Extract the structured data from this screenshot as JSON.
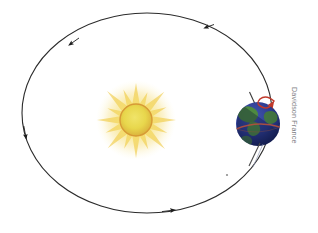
{
  "figure": {
    "background_color": "#ffffff",
    "width": 318,
    "height": 233
  },
  "orbit": {
    "label": "Earth orbital path",
    "shape": "ellipse",
    "center_x": 147,
    "center_y": 113,
    "radius_x": 125,
    "radius_y": 100,
    "stroke_color": "#2b2b2b",
    "stroke_width": 1.1,
    "direction": "counterclockwise",
    "arrow_color": "#1d1d1d",
    "arrow_count": 4,
    "arrows": [
      {
        "name": "orbit-arrow-top-right",
        "position_deg": 300,
        "label": "direction of revolution"
      },
      {
        "name": "orbit-arrow-top-left",
        "position_deg": 230,
        "label": "direction of revolution"
      },
      {
        "name": "orbit-arrow-left",
        "position_deg": 168,
        "label": "direction of revolution"
      },
      {
        "name": "orbit-arrow-bottom",
        "position_deg": 75,
        "label": "direction of revolution"
      }
    ]
  },
  "sun": {
    "label": "Sun",
    "center_x": 136,
    "center_y": 120,
    "core_radius": 16,
    "core_color": "#e8d94a",
    "rim_color": "#e0a23c",
    "glow_color": "#f6e27a",
    "ray_color": "#f2cf55",
    "ray_count": 16
  },
  "earth": {
    "label": "Earth",
    "center_x": 258,
    "center_y": 124,
    "radius": 22,
    "ocean_color": "#2b3a8c",
    "land_color": "#4f8f36",
    "shadow_color": "#101a44",
    "equator_color": "#b5503c",
    "axis": {
      "name": "earth-rotation-axis",
      "tilt_degrees": 23.5,
      "stroke_color": "#3a3a3a",
      "stroke_width": 1.1
    },
    "rotation_arrow": {
      "name": "earth-rotation-arrow",
      "color": "#c0392b",
      "direction": "counterclockwise"
    }
  },
  "marker": {
    "label": "orbit reference dot",
    "x": 227,
    "y": 175,
    "color": "#8f8f8f"
  },
  "credit": {
    "text": "Davidson France",
    "color": "#6d6d72",
    "orientation": "vertical"
  }
}
